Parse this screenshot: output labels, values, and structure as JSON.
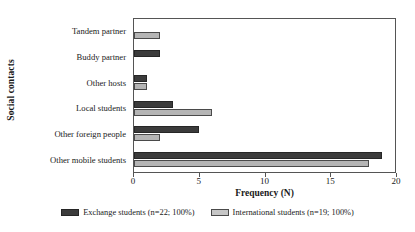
{
  "chart_data": {
    "type": "bar",
    "orientation": "horizontal",
    "title": "",
    "xlabel": "Frequency (N)",
    "ylabel": "Social contacts",
    "xlim": [
      0,
      20
    ],
    "xticks": [
      0,
      5,
      10,
      15,
      20
    ],
    "xtick_labels": [
      "0",
      "5",
      "10",
      "15",
      "20"
    ],
    "grid": false,
    "legend_position": "bottom",
    "categories": [
      "Tandem partner",
      "Buddy partner",
      "Other hosts",
      "Local students",
      "Other foreign people",
      "Other mobile students"
    ],
    "series": [
      {
        "name": "Exchange students (n=22; 100%)",
        "color": "#3b3b3b",
        "values": [
          0,
          2,
          1,
          3,
          5,
          19
        ]
      },
      {
        "name": "International students (n=19; 100%)",
        "color": "#b5b5b5",
        "values": [
          2,
          0,
          1,
          6,
          2,
          18
        ]
      }
    ]
  },
  "legend": {
    "entries": [
      {
        "label": "Exchange students (n=22; 100%)"
      },
      {
        "label": "International students (n=19; 100%)"
      }
    ]
  }
}
